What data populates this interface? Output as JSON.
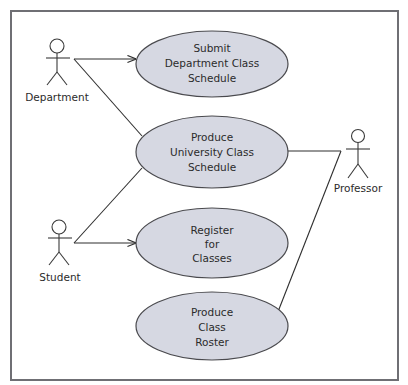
{
  "diagram": {
    "type": "UML use case diagram",
    "colors": {
      "use_case_fill": "#d6d8e2",
      "use_case_stroke": "#4a4a4e",
      "frame_stroke": "#6f6f74",
      "line": "#2e2e2e"
    },
    "actors": [
      {
        "id": "department",
        "label": "Department"
      },
      {
        "id": "student",
        "label": "Student"
      },
      {
        "id": "professor",
        "label": "Professor"
      }
    ],
    "use_cases": [
      {
        "id": "submit",
        "lines": [
          "Submit",
          "Department Class",
          "Schedule"
        ]
      },
      {
        "id": "produce_schedule",
        "lines": [
          "Produce",
          "University Class",
          "Schedule"
        ]
      },
      {
        "id": "register",
        "lines": [
          "Register",
          "for",
          "Classes"
        ]
      },
      {
        "id": "produce_roster",
        "lines": [
          "Produce",
          "Class",
          "Roster"
        ]
      }
    ],
    "associations": [
      {
        "from": "Department",
        "to": "Submit Department Class Schedule",
        "arrow": true
      },
      {
        "from": "Department",
        "to": "Produce University Class Schedule",
        "arrow": false
      },
      {
        "from": "Student",
        "to": "Produce University Class Schedule",
        "arrow": false
      },
      {
        "from": "Student",
        "to": "Register for Classes",
        "arrow": true
      },
      {
        "from": "Professor",
        "to": "Produce University Class Schedule",
        "arrow": false
      },
      {
        "from": "Professor",
        "to": "Produce Class Roster",
        "arrow": false
      }
    ]
  }
}
